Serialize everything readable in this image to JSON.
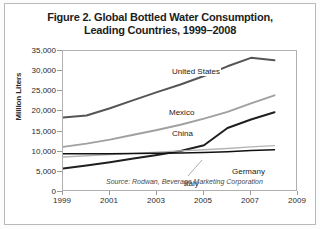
{
  "figure": {
    "title_line1": "Figure 2. Global Bottled Water Consumption,",
    "title_line2": "Leading Countries, 1999–2008",
    "source_note": "Source: Rodwan, Beverage Marketing Corporation"
  },
  "chart_data": {
    "type": "line",
    "title": "Figure 2. Global Bottled Water Consumption, Leading Countries, 1999–2008",
    "xlabel": "",
    "ylabel": "Million Liters",
    "ylim": [
      0,
      35000
    ],
    "xlim": [
      1999,
      2009
    ],
    "ytick_labels": [
      "0",
      "5,000",
      "10,000",
      "15,000",
      "20,000",
      "25,000",
      "30,000",
      "35,000"
    ],
    "ytick_values": [
      0,
      5000,
      10000,
      15000,
      20000,
      25000,
      30000,
      35000
    ],
    "xtick_labels": [
      "1999",
      "2001",
      "2003",
      "2005",
      "2007",
      "2009"
    ],
    "xtick_values": [
      1999,
      2001,
      2003,
      2005,
      2007,
      2009
    ],
    "grid": false,
    "legend": "inline-labels",
    "x": [
      1999,
      2000,
      2001,
      2002,
      2003,
      2004,
      2005,
      2006,
      2007,
      2008
    ],
    "series": [
      {
        "name": "United States",
        "color": "#555555",
        "width": 2.0,
        "values": [
          18500,
          19000,
          20800,
          22800,
          24800,
          26700,
          28800,
          31200,
          33300,
          32700
        ],
        "label_x": 108,
        "label_y": 16
      },
      {
        "name": "Mexico",
        "color": "#a0a0a0",
        "width": 1.9,
        "values": [
          11200,
          12000,
          13000,
          14200,
          15400,
          16700,
          18200,
          19900,
          22000,
          24000
        ],
        "label_x": 105,
        "label_y": 57
      },
      {
        "name": "China",
        "color": "#1f1f1f",
        "width": 2.0,
        "values": [
          5800,
          6600,
          7400,
          8300,
          9200,
          10200,
          11600,
          15900,
          18000,
          19800
        ],
        "label_x": 108,
        "label_y": 78
      },
      {
        "name": "Italy",
        "color": "#b4b4b4",
        "width": 1.4,
        "values": [
          8700,
          9000,
          9300,
          9600,
          9900,
          10200,
          10500,
          10800,
          11200,
          11500
        ],
        "label_x": 120,
        "label_y": 128
      },
      {
        "name": "Germany",
        "color": "#111111",
        "width": 1.5,
        "values": [
          9500,
          9500,
          9500,
          9550,
          9600,
          9700,
          9800,
          10000,
          10300,
          10500
        ],
        "label_x": 168,
        "label_y": 116
      }
    ]
  }
}
